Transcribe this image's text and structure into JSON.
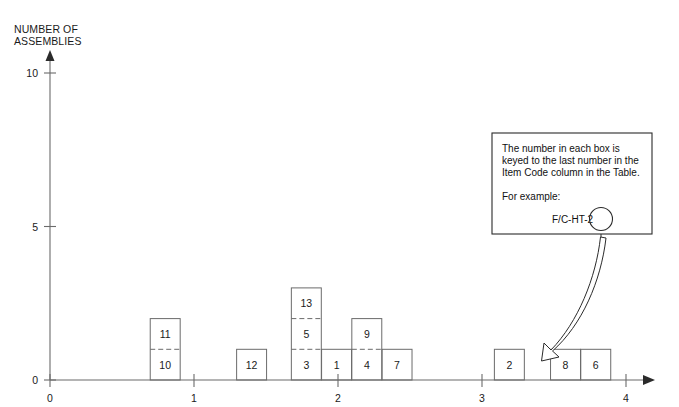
{
  "figure": {
    "title_clipped": "FIGURE 3. HISTOGRAM OF ASSEMBLIES",
    "y_axis_title_line1": "NUMBER OF",
    "y_axis_title_line2": "ASSEMBLIES"
  },
  "callout": {
    "line1": "The number in each box is",
    "line2": "keyed to the last number in the",
    "line3": "Item Code column in the Table.",
    "line4": "For example:",
    "example_code": "F/C-HT-2",
    "circled_value": "2"
  },
  "chart_data": {
    "type": "bar",
    "title": "",
    "xlabel": "",
    "ylabel": "NUMBER OF ASSEMBLIES",
    "xlim": [
      0,
      4
    ],
    "ylim": [
      0,
      10
    ],
    "x_ticks": [
      "0",
      "1",
      "2",
      "3",
      "4"
    ],
    "x_tick_values": [
      0,
      1,
      2,
      3,
      4
    ],
    "y_ticks": [
      "0",
      "5",
      "10"
    ],
    "y_tick_values": [
      0,
      5,
      10
    ],
    "grid": false,
    "legend": false,
    "bar_width_units": 0.208,
    "note": "Each bar is a stack of unit-height boxes; each box is labeled with an item code suffix number.",
    "bars": [
      {
        "x": 0.8,
        "height": 2,
        "box_labels": [
          "10",
          "11"
        ]
      },
      {
        "x": 1.4,
        "height": 1,
        "box_labels": [
          "12"
        ]
      },
      {
        "x": 1.78,
        "height": 3,
        "box_labels": [
          "3",
          "5",
          "13"
        ]
      },
      {
        "x": 1.99,
        "height": 1,
        "box_labels": [
          "1"
        ]
      },
      {
        "x": 2.2,
        "height": 2,
        "box_labels": [
          "4",
          "9"
        ]
      },
      {
        "x": 2.41,
        "height": 1,
        "box_labels": [
          "7"
        ]
      },
      {
        "x": 3.19,
        "height": 1,
        "box_labels": [
          "2"
        ]
      },
      {
        "x": 3.58,
        "height": 1,
        "box_labels": [
          "8"
        ]
      },
      {
        "x": 3.79,
        "height": 1,
        "box_labels": [
          "6"
        ]
      }
    ]
  },
  "colors": {
    "background": "#ffffff",
    "axis": "#6b6b6b",
    "bar_stroke": "#6b6b6b",
    "text": "#1a1a1a",
    "callout_stroke": "#2b2b2b"
  }
}
